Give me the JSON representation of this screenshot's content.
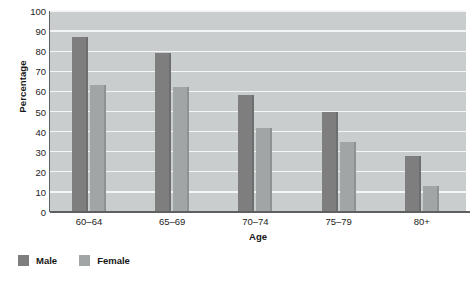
{
  "chart_data": {
    "type": "bar",
    "title": "",
    "xlabel": "Age",
    "ylabel": "Percentage",
    "categories": [
      "60–64",
      "65–69",
      "70–74",
      "75–79",
      "80+"
    ],
    "series": [
      {
        "name": "Male",
        "color": "#7e7e7f",
        "values": [
          87,
          79,
          58,
          50,
          28
        ]
      },
      {
        "name": "Female",
        "color": "#a2a5a5",
        "values": [
          63,
          62,
          42,
          35,
          13
        ]
      }
    ],
    "ylim": [
      0,
      100
    ],
    "ytick_values": [
      0,
      10,
      20,
      30,
      40,
      50,
      60,
      70,
      80,
      90,
      100
    ],
    "ytick_labels": [
      "0",
      "10",
      "20",
      "30",
      "40",
      "50",
      "60",
      "70",
      "80",
      "90",
      "100"
    ],
    "grid": "horizontal",
    "legend_position": "below-left",
    "plot_background": "#c9cdce",
    "gridline_color": "#f4f5f5",
    "axis_color": "#5d5f60"
  },
  "legend": {
    "items": [
      {
        "label": "Male",
        "swatch": "legend-swatch-male"
      },
      {
        "label": "Female",
        "swatch": "legend-swatch-female"
      }
    ]
  }
}
